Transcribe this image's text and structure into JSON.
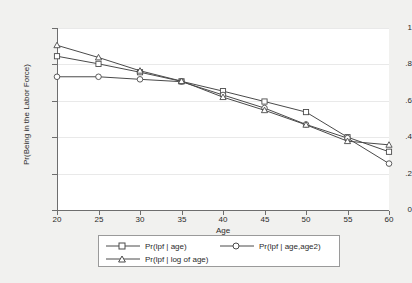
{
  "chart_data": {
    "type": "line",
    "title": "",
    "xlabel": "Age",
    "ylabel": "Pr(Being in the Labor Force)",
    "x": [
      20,
      25,
      30,
      35,
      40,
      45,
      50,
      55,
      60
    ],
    "xlim": [
      20,
      60
    ],
    "ylim": [
      0,
      1
    ],
    "xticks": [
      "20",
      "25",
      "30",
      "35",
      "40",
      "45",
      "50",
      "55",
      "60"
    ],
    "yticks": [
      "0",
      ".2",
      ".4",
      ".6",
      ".8",
      "1"
    ],
    "ytick_values": [
      0,
      0.2,
      0.4,
      0.6,
      0.8,
      1
    ],
    "grid": "horizontal",
    "legend_position": "below-axes",
    "series": [
      {
        "name": "Pr(lpf | age)",
        "marker": "square",
        "color": "#4a4a4a",
        "values": [
          0.845,
          0.803,
          0.757,
          0.707,
          0.653,
          0.596,
          0.538,
          0.4,
          0.32
        ]
      },
      {
        "name": "Pr(lpf | age,age2)",
        "marker": "circle",
        "color": "#4a4a4a",
        "values": [
          0.732,
          0.732,
          0.718,
          0.705,
          0.632,
          0.56,
          0.47,
          0.395,
          0.255
        ]
      },
      {
        "name": "Pr(lpf | log of age)",
        "marker": "triangle",
        "color": "#4a4a4a",
        "values": [
          0.905,
          0.838,
          0.765,
          0.708,
          0.62,
          0.548,
          0.468,
          0.378,
          0.358
        ]
      }
    ]
  },
  "figure": {
    "background_color": "#f1f1ef",
    "plot_background_color": "#ffffff",
    "axis_color": "#6e6e6e",
    "grid_color": "#e9e9e9",
    "text_color": "#2b2b2b"
  }
}
